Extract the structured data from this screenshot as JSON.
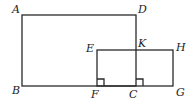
{
  "diagram": {
    "type": "geometry",
    "points": {
      "A": {
        "label": "A",
        "x": 22,
        "y": 15,
        "lx": 12,
        "ly": 13
      },
      "D": {
        "label": "D",
        "x": 136,
        "y": 15,
        "lx": 138,
        "ly": 13
      },
      "B": {
        "label": "B",
        "x": 22,
        "y": 86,
        "lx": 12,
        "ly": 94
      },
      "C": {
        "label": "C",
        "x": 136,
        "y": 86,
        "lx": 129,
        "ly": 98
      },
      "E": {
        "label": "E",
        "x": 97,
        "y": 50,
        "lx": 86,
        "ly": 52
      },
      "K": {
        "label": "K",
        "x": 136,
        "y": 50,
        "lx": 138,
        "ly": 47
      },
      "H": {
        "label": "H",
        "x": 173,
        "y": 50,
        "lx": 176,
        "ly": 51
      },
      "F": {
        "label": "F",
        "x": 97,
        "y": 86,
        "lx": 91,
        "ly": 98
      },
      "G": {
        "label": "G",
        "x": 173,
        "y": 86,
        "lx": 176,
        "ly": 96
      }
    },
    "shapes": [
      {
        "name": "rectangle-ABCD",
        "vertices": [
          "A",
          "D",
          "C",
          "B"
        ]
      },
      {
        "name": "rectangle-EFGH",
        "vertices": [
          "E",
          "H",
          "G",
          "F"
        ]
      }
    ],
    "right_angle_markers": [
      "F",
      "C"
    ],
    "colors": {
      "line": "#2a2a2a",
      "background": "#ffffff",
      "text": "#222222"
    }
  }
}
